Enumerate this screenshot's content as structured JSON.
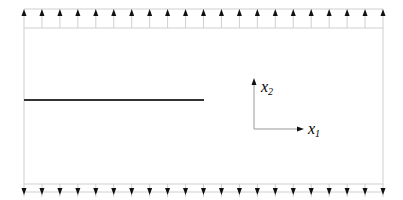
{
  "diagram": {
    "type": "cracked-plate-under-tension",
    "axes": {
      "x1_label": "x",
      "x1_sub": "1",
      "x2_label": "x",
      "x2_sub": "2"
    },
    "load": {
      "top_arrow_count": 21,
      "bottom_arrow_count": 21,
      "direction_top": "up",
      "direction_bottom": "down"
    },
    "crack": {
      "description": "edge crack from left boundary to mid-plate"
    },
    "colors": {
      "body_outline": "#c8c8c8",
      "arrow": "#111111",
      "crack": "#333333",
      "axis": "#999999"
    }
  }
}
